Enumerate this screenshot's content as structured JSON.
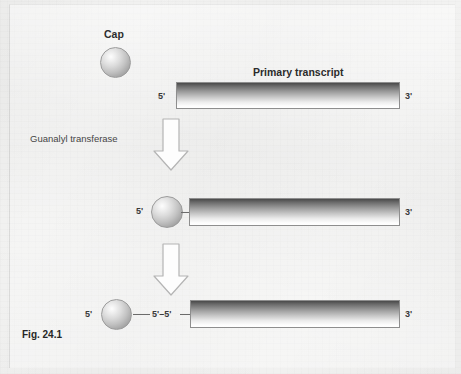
{
  "figure": {
    "caption": "Fig. 24.1",
    "title": "Primary transcript",
    "cap_label": "Cap",
    "enzyme_label": "Guanalyl transferase",
    "linkage_label": "5'–5'",
    "five_prime": "5'",
    "three_prime": "3'",
    "colors": {
      "background": "#f2f2f1",
      "bar_top": "#4a4a4a",
      "bar_bottom": "#ffffff",
      "bar_border": "#8e8e8e",
      "sphere_highlight": "#fdfdfd",
      "sphere_shadow": "#848484",
      "text": "#2d2d2d",
      "arrow_outline": "#b4b4b4",
      "arrow_fill": "#fdfdfd"
    }
  },
  "stages": [
    {
      "name": "uncapped-transcript",
      "five_prime": "5'",
      "three_prime": "3'",
      "title": "Primary transcript",
      "has_cap": false
    },
    {
      "name": "cap-attached-transcript",
      "five_prime": "5'",
      "three_prime": "3'",
      "has_cap": true
    },
    {
      "name": "capped-transcript-with-linkage",
      "five_prime": "5'",
      "three_prime": "3'",
      "linkage_label": "5'–5'",
      "has_cap": true
    }
  ],
  "arrows": [
    {
      "name": "guanylyl-transferase-step",
      "label": "Guanalyl transferase"
    },
    {
      "name": "linkage-formation-step",
      "label": ""
    }
  ]
}
